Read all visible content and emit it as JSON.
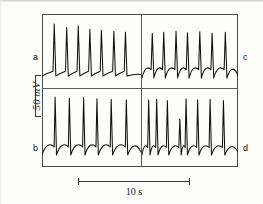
{
  "figure": {
    "type": "electrophysiology-recording",
    "background_color": "#fdfdfc",
    "trace_color": "#111111",
    "frame_color": "#4c4c4c"
  },
  "panels": {
    "a": {
      "label": "a",
      "position": "top-left"
    },
    "b": {
      "label": "b",
      "position": "bottom-left"
    },
    "c": {
      "label": "c",
      "position": "top-right"
    },
    "d": {
      "label": "d",
      "position": "bottom-right"
    }
  },
  "scalebars": {
    "voltage": {
      "amount": "50",
      "unit": "mV",
      "orientation": "vertical",
      "position": "left"
    },
    "time": {
      "label": "10 s",
      "amount": "10",
      "unit": "s",
      "orientation": "horizontal",
      "position": "bottom"
    }
  },
  "chart_data": {
    "type": "line",
    "title": "",
    "xlabel": "",
    "ylabel": "",
    "grid": false,
    "legend": "none",
    "axis_note": "No numeric axes; calibration bars only (50 mV vertical, 10 s horizontal).",
    "panel_layout": {
      "rows": 2,
      "cols": 2,
      "order": [
        "a",
        "c",
        "b",
        "d"
      ]
    },
    "series": [
      {
        "name": "a",
        "panel": "a",
        "description": "Regular pacemaker-like firing; slow depolarizing ramps terminating in tall fast spikes.",
        "spike_count": 7,
        "spike_times_rel": [
          0.07,
          0.21,
          0.34,
          0.47,
          0.6,
          0.74,
          0.87
        ],
        "spike_amplitudes_rel": [
          1.0,
          0.93,
          0.96,
          0.9,
          0.88,
          0.86,
          0.84
        ],
        "baseline_rel": 0.12
      },
      {
        "name": "c",
        "panel": "c",
        "description": "Continuation of upper trace; slightly faster firing with rounded interspike depolarizations.",
        "spike_count": 7,
        "spike_times_rel": [
          0.06,
          0.19,
          0.33,
          0.46,
          0.6,
          0.74,
          0.89
        ],
        "spike_amplitudes_rel": [
          0.86,
          0.88,
          0.9,
          0.87,
          0.89,
          0.86,
          0.88
        ],
        "baseline_rel": 0.14
      },
      {
        "name": "b",
        "panel": "b",
        "description": "Bursting pattern with tall narrow spikes riding on rounded slow-wave humps.",
        "spike_count": 6,
        "spike_times_rel": [
          0.08,
          0.24,
          0.4,
          0.55,
          0.71,
          0.88
        ],
        "spike_amplitudes_rel": [
          1.0,
          0.98,
          0.99,
          0.97,
          0.96,
          0.95
        ],
        "baseline_rel": 0.1
      },
      {
        "name": "d",
        "panel": "d",
        "description": "Continuation of lower trace; irregular firing including one truncated smaller spike.",
        "spike_count": 8,
        "spike_times_rel": [
          0.03,
          0.12,
          0.24,
          0.38,
          0.45,
          0.58,
          0.72,
          0.87
        ],
        "spike_amplitudes_rel": [
          0.95,
          0.96,
          0.94,
          0.62,
          0.97,
          0.95,
          0.96,
          0.94
        ],
        "baseline_rel": 0.1
      }
    ]
  }
}
